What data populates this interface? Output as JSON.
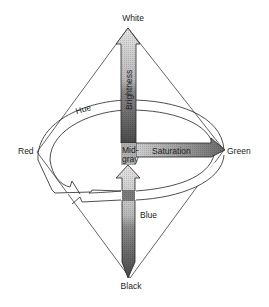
{
  "diagram": {
    "type": "color-space-double-cone",
    "labels": {
      "top": "White",
      "bottom": "Black",
      "left": "Red",
      "right": "Green",
      "ring": "Hue",
      "vertical_axis": "Brightness",
      "horizontal_axis": "Saturation",
      "center_line1": "Mid-",
      "center_line2": "gray",
      "lower_ring": "Blue"
    },
    "colors": {
      "line": "#222222",
      "arrow_light": "#d6d6d6",
      "arrow_mid": "#9a9a9a",
      "arrow_dark": "#555555",
      "background": "#ffffff"
    }
  }
}
